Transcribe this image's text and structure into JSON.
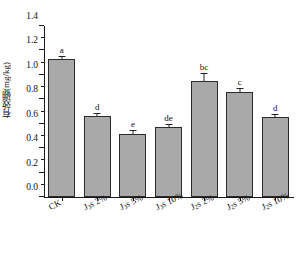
{
  "chart_data": {
    "type": "bar",
    "title": "",
    "xlabel": "",
    "ylabel": "有效硼(mg/kg)",
    "ylim": [
      0.0,
      1.4
    ],
    "ytick_labels": [
      "1.4",
      "1.2",
      "1.0",
      "0.8",
      "0.6",
      "0.4",
      "0.2",
      "0.0"
    ],
    "ytick_values": [
      1.4,
      1.2,
      1.0,
      0.8,
      0.6,
      0.4,
      0.2,
      0.0
    ],
    "grid": false,
    "legend": "none",
    "categories": [
      "CK",
      "J₃s 2%",
      "J₃s 5%",
      "J₃s 10%",
      "J₂s 2%",
      "J₂s 5%",
      "J₂s 10%"
    ],
    "category_parts": [
      {
        "base": "CK",
        "sub": "",
        "tail": ""
      },
      {
        "base": "J",
        "sub": "3",
        "tail": "s 2%"
      },
      {
        "base": "J",
        "sub": "3",
        "tail": "s 5%"
      },
      {
        "base": "J",
        "sub": "3",
        "tail": "s 10%"
      },
      {
        "base": "J",
        "sub": "2",
        "tail": "s 2%"
      },
      {
        "base": "J",
        "sub": "2",
        "tail": "s 5%"
      },
      {
        "base": "J",
        "sub": "2",
        "tail": "s 10%"
      }
    ],
    "values": [
      1.13,
      0.66,
      0.52,
      0.57,
      0.95,
      0.86,
      0.655
    ],
    "errors": [
      0.02,
      0.02,
      0.02,
      0.02,
      0.06,
      0.025,
      0.02
    ],
    "sig_letters": [
      "a",
      "d",
      "e",
      "de",
      "bc",
      "c",
      "d"
    ],
    "series": [
      {
        "name": "有效硼",
        "values": [
          1.13,
          0.66,
          0.52,
          0.57,
          0.95,
          0.86,
          0.655
        ]
      }
    ],
    "bar_color": "#a9a9a9",
    "bar_edge_color": "#2b2b2b",
    "axis_color": "#1a1a1a"
  }
}
